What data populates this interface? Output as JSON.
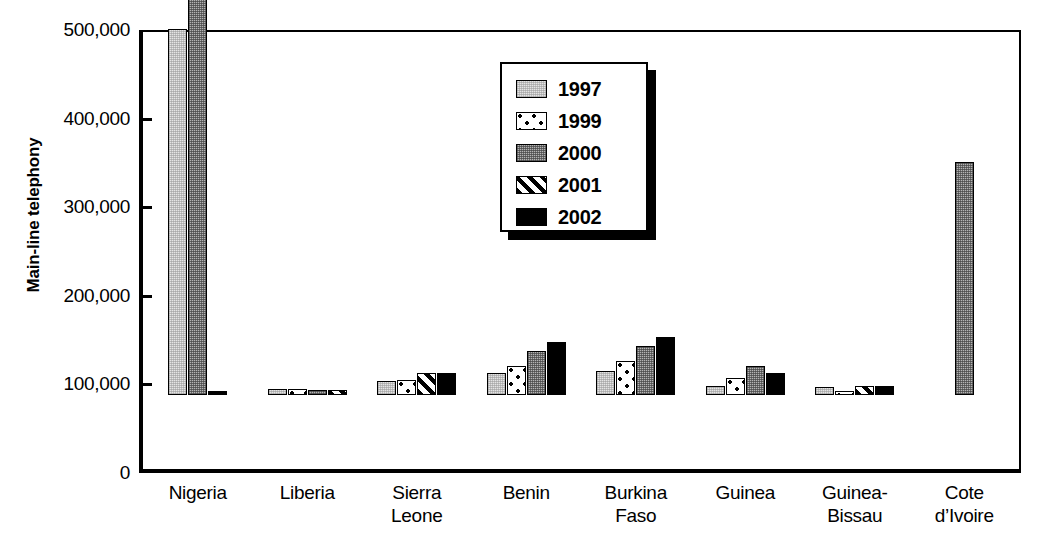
{
  "chart_data": {
    "type": "bar",
    "title": "",
    "xlabel": "",
    "ylabel": "Main-line telephony",
    "ylim": [
      0,
      500000
    ],
    "ytick_labels": [
      "500,000",
      "400,000",
      "300,000",
      "200,000",
      "100,000",
      "0"
    ],
    "ytick_values": [
      500000,
      400000,
      300000,
      200000,
      100000,
      0
    ],
    "grid": false,
    "legend_position": "upper-center",
    "categories": [
      "Nigeria",
      "Liberia",
      "Sierra Leone",
      "Benin",
      "Burkina Faso",
      "Guinea",
      "Guinea-Bissau",
      "Cote d'Ivoire"
    ],
    "category_lines": [
      [
        "Nigeria"
      ],
      [
        "Liberia"
      ],
      [
        "Sierra",
        "Leone"
      ],
      [
        "Benin"
      ],
      [
        "Burkina",
        "Faso"
      ],
      [
        "Guinea"
      ],
      [
        "Guinea-",
        "Bissau"
      ],
      [
        "Cote",
        "d’Ivoire"
      ]
    ],
    "series": [
      {
        "name": "1997",
        "pattern": "light-gray-stipple",
        "values": [
          413000,
          6500,
          16000,
          25000,
          27000,
          10000,
          9000,
          null
        ]
      },
      {
        "name": "1999",
        "pattern": "white-dotted",
        "values": [
          null,
          6500,
          17000,
          33000,
          38000,
          19000,
          4000,
          null
        ]
      },
      {
        "name": "2000",
        "pattern": "medium-gray-stipple",
        "values": [
          508000,
          6000,
          null,
          50000,
          55000,
          33000,
          null,
          263000
        ]
      },
      {
        "name": "2001",
        "pattern": "diagonal-hatch",
        "values": [
          null,
          5500,
          25000,
          null,
          null,
          null,
          10000,
          null
        ]
      },
      {
        "name": "2002",
        "pattern": "solid-black",
        "values": [
          2000,
          null,
          25000,
          60000,
          65000,
          25000,
          10000,
          null
        ]
      }
    ]
  },
  "legend": {
    "items": [
      {
        "label": "1997",
        "swatch": "fill-1997"
      },
      {
        "label": "1999",
        "swatch": "fill-1999"
      },
      {
        "label": "2000",
        "swatch": "fill-2000"
      },
      {
        "label": "2001",
        "swatch": "fill-2001"
      },
      {
        "label": "2002",
        "swatch": "fill-2002"
      }
    ]
  },
  "colors": {
    "axis": "#000000",
    "plot_background": "#ffffff",
    "series_1997": "#e4e4e4",
    "series_1999": "#ffffff",
    "series_2000": "#b4b4b4",
    "series_2001": "#ffffff",
    "series_2002": "#000000"
  }
}
